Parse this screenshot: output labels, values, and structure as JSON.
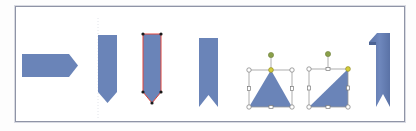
{
  "canvas": {
    "description": "Slide canvas showing basic shapes being edited",
    "frame_border_color": "#8f94a6",
    "fill_color": "#6a84b8",
    "selection_outline_color": "#e0453a",
    "handle_color": "#ffffff",
    "handle_stroke": "#7a7a7a",
    "adjust_handle_color": "#d4cc3a",
    "rotate_handle_color": "#8aa04a"
  },
  "shapes": [
    {
      "name": "pentagon-arrow-horizontal",
      "selected": false
    },
    {
      "name": "pentagon-arrow-vertical",
      "selected": false
    },
    {
      "name": "pentagon-arrow-vertical-selected",
      "selected": true,
      "edit_points": true
    },
    {
      "name": "ribbon-tail",
      "selected": false
    },
    {
      "name": "isosceles-triangle",
      "selected": true
    },
    {
      "name": "right-triangle",
      "selected": true
    },
    {
      "name": "folded-bookmark",
      "selected": false
    }
  ]
}
